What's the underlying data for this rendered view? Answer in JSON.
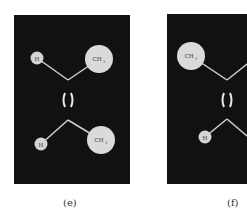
{
  "figure": {
    "panels": [
      {
        "id": "e",
        "caption": "(e)",
        "isomer": "cis",
        "atoms": {
          "top_left": "H",
          "top_right": "CH3",
          "bottom_left": "H",
          "bottom_right": "CH3"
        },
        "labels": {
          "top_left": "H",
          "top_right": "CH",
          "top_right_sub": "3",
          "bottom_left": "H",
          "bottom_right": "CH",
          "bottom_right_sub": "3"
        }
      },
      {
        "id": "f",
        "caption": "(f)",
        "isomer": "trans",
        "atoms": {
          "top_left": "CH3",
          "bottom_left": "H"
        },
        "labels": {
          "top_left": "CH",
          "top_left_sub": "3",
          "bottom_left": "H"
        }
      }
    ],
    "colors": {
      "background": "#111111",
      "atom_fill": "#d9d9d9",
      "bond": "#cfcfcf",
      "page": "#ffffff"
    }
  }
}
